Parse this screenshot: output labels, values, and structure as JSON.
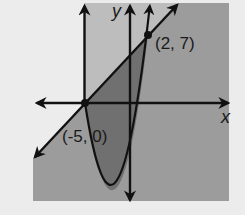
{
  "figure": {
    "axes": {
      "x_label": "x",
      "y_label": "y"
    },
    "points": [
      {
        "label": "(-5, 0)",
        "x": -5,
        "y": 0
      },
      {
        "label": "(2, 7)",
        "x": 2,
        "y": 7
      }
    ],
    "curves": {
      "line": "y = x + 5",
      "parabola": "y = x^2 + 4x - 5",
      "vertical_line": "x = -5"
    },
    "colors": {
      "background": "#ececec",
      "light_region": "#bdbdbd",
      "medium_region": "#9c9c9c",
      "dark_region": "#6f6f6f",
      "stroke": "#111111"
    }
  }
}
